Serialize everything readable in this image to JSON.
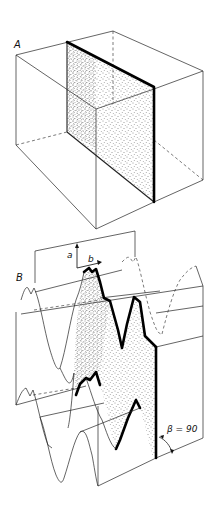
{
  "figure": {
    "panel_a": {
      "label": "A",
      "description": "Rectangular block with a stippled vertical plane cutting through it"
    },
    "panel_b": {
      "label": "B",
      "axis_a_label": "a",
      "axis_b_label": "b",
      "angle_label": "β = 90",
      "description": "Corrugated (folded) layer block with stippled section plane perpendicular to fold axis"
    },
    "colors": {
      "line": "#222222",
      "bold_line": "#000000",
      "stipple": "#333333",
      "background": "#ffffff"
    }
  }
}
